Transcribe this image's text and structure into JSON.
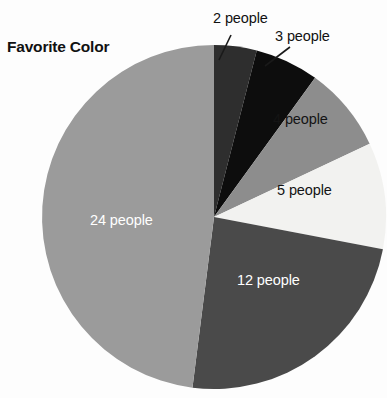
{
  "chart_data": {
    "type": "pie",
    "title": "Favorite Color",
    "xlabel": "",
    "ylabel": "",
    "legend_position": "none",
    "grid": false,
    "unit": "people",
    "total": 50,
    "categories": [
      "2 people",
      "3 people",
      "4 people",
      "5 people",
      "12 people",
      "24 people"
    ],
    "values": [
      2,
      3,
      4,
      5,
      12,
      24
    ],
    "slices": [
      {
        "label": "2 people",
        "value": 2,
        "percent": 4,
        "color": "#2e2e2e",
        "start_angle": 0,
        "end_angle": 14.4,
        "label_placement": "outside",
        "label_color": "#111111",
        "leader_line": true
      },
      {
        "label": "3 people",
        "value": 3,
        "percent": 6,
        "color": "#0d0d0d",
        "start_angle": 14.4,
        "end_angle": 36,
        "label_placement": "outside",
        "label_color": "#111111",
        "leader_line": true
      },
      {
        "label": "4 people",
        "value": 4,
        "percent": 8,
        "color": "#8d8d8d",
        "start_angle": 36,
        "end_angle": 64.8,
        "label_placement": "inside",
        "label_color": "#141414",
        "leader_line": false
      },
      {
        "label": "5 people",
        "value": 5,
        "percent": 10,
        "color": "#f2f2f0",
        "start_angle": 64.8,
        "end_angle": 100.8,
        "label_placement": "inside",
        "label_color": "#141414",
        "leader_line": false
      },
      {
        "label": "12 people",
        "value": 12,
        "percent": 24,
        "color": "#4a4a4a",
        "start_angle": 100.8,
        "end_angle": 187.2,
        "label_placement": "inside",
        "label_color": "#ffffff",
        "leader_line": false
      },
      {
        "label": "24 people",
        "value": 24,
        "percent": 48,
        "color": "#9b9b9b",
        "start_angle": 187.2,
        "end_angle": 360,
        "label_placement": "inside",
        "label_color": "#ffffff",
        "leader_line": false
      }
    ],
    "geometry": {
      "center_x": 214,
      "center_y": 217,
      "radius": 172
    }
  },
  "labels": {
    "title": "Favorite Color",
    "slice_2": "2 people",
    "slice_3": "3 people",
    "slice_4": "4 people",
    "slice_5": "5 people",
    "slice_12": "12 people",
    "slice_24": "24 people"
  },
  "colors": {
    "background": "#fdfdfd",
    "text_dark": "#111111",
    "text_light": "#ffffff",
    "slice_2": "#2e2e2e",
    "slice_3": "#0d0d0d",
    "slice_4": "#8d8d8d",
    "slice_5": "#f2f2f0",
    "slice_12": "#4a4a4a",
    "slice_24": "#9b9b9b",
    "leader_line": "#1a1a1a"
  }
}
